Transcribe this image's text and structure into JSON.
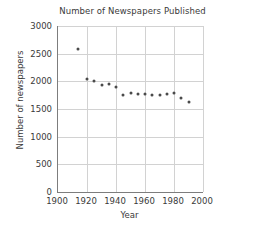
{
  "chart_data": {
    "type": "scatter",
    "title": "Number of Newspapers Published",
    "xlabel": "Year",
    "ylabel": "Number of newspapers",
    "xlim": [
      1900,
      2000
    ],
    "ylim": [
      0,
      3000
    ],
    "xticks": [
      1900,
      1920,
      1940,
      1960,
      1980,
      2000
    ],
    "yticks": [
      0,
      500,
      1000,
      1500,
      2000,
      2500,
      3000
    ],
    "grid": true,
    "legend": "none",
    "marker_color": "#4a4a4a",
    "x": [
      1914,
      1920,
      1925,
      1930,
      1935,
      1940,
      1945,
      1950,
      1955,
      1960,
      1965,
      1970,
      1975,
      1980,
      1985,
      1990
    ],
    "values": [
      2580,
      2050,
      2010,
      1940,
      1960,
      1900,
      1760,
      1790,
      1770,
      1770,
      1760,
      1760,
      1770,
      1790,
      1690,
      1630
    ],
    "series": [
      {
        "name": "Number of newspapers",
        "values": [
          2580,
          2050,
          2010,
          1940,
          1960,
          1900,
          1760,
          1790,
          1770,
          1770,
          1760,
          1760,
          1770,
          1790,
          1690,
          1630
        ]
      }
    ]
  }
}
